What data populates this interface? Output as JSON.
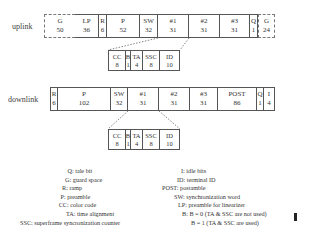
{
  "uplink": {
    "label": "uplink",
    "fields": [
      {
        "name": "G",
        "bits": "50",
        "style": "dashed",
        "width": 31
      },
      {
        "name": "LP",
        "bits": "36",
        "width": 24
      },
      {
        "name": "R",
        "bits": "6",
        "width": 8
      },
      {
        "name": "P",
        "bits": "52",
        "width": 33
      },
      {
        "name": "SW",
        "bits": "32",
        "width": 18
      },
      {
        "name": "#1",
        "bits": "31",
        "width": 31
      },
      {
        "name": "#2",
        "bits": "31",
        "width": 31
      },
      {
        "name": "#3",
        "bits": "31",
        "width": 30
      },
      {
        "name": "Q",
        "bits": "1",
        "width": 8
      },
      {
        "name": "G",
        "bits": "24",
        "style": "dashed",
        "width": 17
      }
    ],
    "subfields": [
      {
        "name": "CC",
        "bits": "8",
        "width": 18
      },
      {
        "name": "B",
        "bits": "1",
        "width": 5
      },
      {
        "name": "TA",
        "bits": "4",
        "width": 12
      },
      {
        "name": "SSC",
        "bits": "8",
        "width": 17
      },
      {
        "name": "ID",
        "bits": "10",
        "width": 20
      }
    ]
  },
  "downlink": {
    "label": "downlink",
    "fields": [
      {
        "name": "R",
        "bits": "6",
        "width": 8
      },
      {
        "name": "P",
        "bits": "102",
        "width": 53
      },
      {
        "name": "SW",
        "bits": "32",
        "width": 17
      },
      {
        "name": "#1",
        "bits": "31",
        "width": 31
      },
      {
        "name": "#2",
        "bits": "31",
        "width": 31
      },
      {
        "name": "#3",
        "bits": "31",
        "width": 28
      },
      {
        "name": "POST",
        "bits": "86",
        "width": 39
      },
      {
        "name": "Q",
        "bits": "1",
        "width": 7
      },
      {
        "name": "I",
        "bits": "4",
        "width": 11
      }
    ],
    "subfields": [
      {
        "name": "CC",
        "bits": "8",
        "width": 18
      },
      {
        "name": "B",
        "bits": "1",
        "width": 5
      },
      {
        "name": "TA",
        "bits": "4",
        "width": 12
      },
      {
        "name": "SSC",
        "bits": "8",
        "width": 17
      },
      {
        "name": "ID",
        "bits": "10",
        "width": 20
      }
    ]
  },
  "legend": {
    "left": [
      "Q: tale bit",
      "G: guard space",
      "R: ramp",
      "P: preamble",
      "CC: color code",
      "TA: time alignment",
      "SSC: superframe syncronization counter"
    ],
    "right": [
      "I: idle bits",
      "ID: terminal ID",
      "POST: postamble",
      "SW: synchronization word",
      "LP: preamble for linearizer",
      "B: B = 0 (TA & SSC are not used)",
      "B = 1 (TA & SSC are used)"
    ]
  }
}
